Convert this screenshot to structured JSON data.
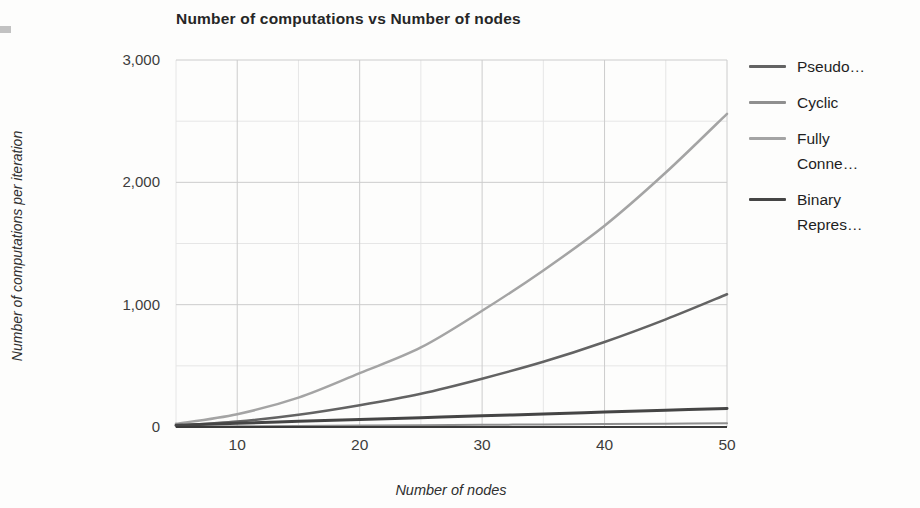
{
  "chart": {
    "title": "Number of computations vs Number of nodes",
    "x_axis_title": "Number of nodes",
    "y_axis_title": "Number of computations per iteration"
  },
  "chart_data": {
    "type": "line",
    "title": "Number of computations vs Number of nodes",
    "xlabel": "Number of nodes",
    "ylabel": "Number of computations per iteration",
    "xlim": [
      5,
      50
    ],
    "ylim": [
      0,
      3000
    ],
    "grid": true,
    "legend_position": "right",
    "x_ticks": [
      {
        "value": 10,
        "label": "10"
      },
      {
        "value": 20,
        "label": "20"
      },
      {
        "value": 30,
        "label": "30"
      },
      {
        "value": 40,
        "label": "40"
      },
      {
        "value": 50,
        "label": "50"
      }
    ],
    "y_ticks": [
      {
        "value": 0,
        "label": "0"
      },
      {
        "value": 1000,
        "label": "1,000"
      },
      {
        "value": 2000,
        "label": "2,000"
      },
      {
        "value": 3000,
        "label": "3,000"
      }
    ],
    "minor_x_gridlines": [
      15,
      25,
      35,
      45
    ],
    "minor_y_gridlines": [
      500,
      1500,
      2500
    ],
    "x": [
      5,
      10,
      15,
      20,
      25,
      30,
      35,
      40,
      45,
      50
    ],
    "series": [
      {
        "name": "Pseudo…",
        "legend_label": "Pseudo…",
        "color": "#636363",
        "line_width": 2.5,
        "values": [
          10,
          44,
          100,
          178,
          272,
          395,
          533,
          695,
          880,
          1085
        ]
      },
      {
        "name": "Cyclic",
        "legend_label": "Cyclic",
        "color": "#8f8f8f",
        "line_width": 2,
        "values": [
          3,
          6,
          9,
          12,
          15,
          18,
          21,
          24,
          27,
          30
        ]
      },
      {
        "name": "Fully Conne…",
        "legend_label": "Fully\nConne…",
        "color": "#a4a4a4",
        "line_width": 2.5,
        "values": [
          26,
          105,
          240,
          440,
          650,
          950,
          1280,
          1645,
          2080,
          2560
        ]
      },
      {
        "name": "Binary Repres…",
        "legend_label": "Binary\nRepres…",
        "color": "#454545",
        "line_width": 3,
        "values": [
          15,
          31,
          46,
          61,
          76,
          91,
          107,
          122,
          137,
          152
        ]
      }
    ],
    "gridline_color_major": "#cccccc",
    "gridline_color_minor": "#e6e6e6",
    "baseline_color": "#3a3a3a"
  }
}
